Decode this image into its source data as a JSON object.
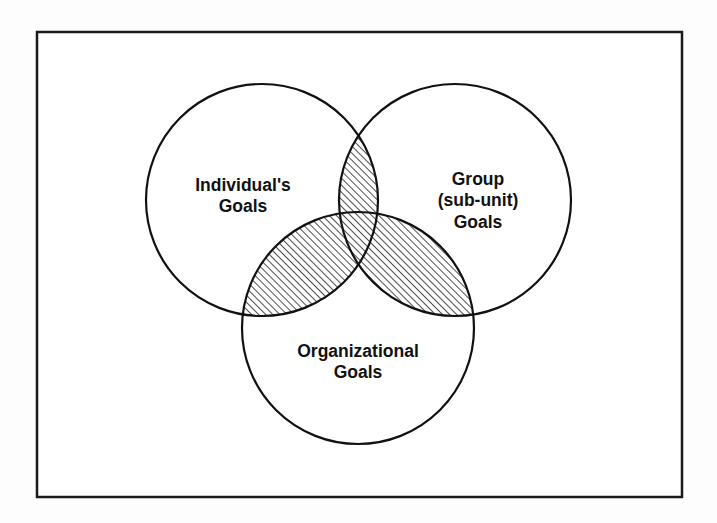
{
  "diagram": {
    "type": "venn",
    "set_count": 3,
    "background_color": "#fdfdfd",
    "frame": {
      "name": "outer-border",
      "stroke_color": "#1a1a1a",
      "fill_color": "#ffffff",
      "x": 37,
      "y": 32,
      "width": 645,
      "height": 465,
      "stroke_width": 2.5
    },
    "style": {
      "circle_stroke_color": "#111111",
      "circle_fill_color": "#ffffff",
      "circle_stroke_width": 2.2,
      "hatch_color": "#111111",
      "hatch_angle_deg": 45,
      "hatch_spacing_px": 5,
      "hatch_line_width": 1.5,
      "label_color": "#111111",
      "label_font_size_px": 17.5,
      "label_font_weight": "bold"
    },
    "circles": [
      {
        "id": "individual",
        "name": "individuals-goals-circle",
        "cx": 262,
        "cy": 200,
        "r": 116,
        "label_lines": [
          "Individual's",
          "Goals"
        ],
        "label_x": 243,
        "label_y": 186
      },
      {
        "id": "group",
        "name": "group-subunit-goals-circle",
        "cx": 455,
        "cy": 200,
        "r": 116,
        "label_lines": [
          "Group",
          "(sub-unit)",
          "Goals"
        ],
        "label_x": 478,
        "label_y": 180
      },
      {
        "id": "organizational",
        "name": "organizational-goals-circle",
        "cx": 358,
        "cy": 328,
        "r": 116,
        "label_lines": [
          "Organizational",
          "Goals"
        ],
        "label_x": 358,
        "label_y": 352
      }
    ],
    "intersections": [
      {
        "id": "individual-group",
        "name": "individual-group-intersection",
        "sets": [
          "individual",
          "group"
        ],
        "shaded": true,
        "shading": "diagonal-hatch"
      },
      {
        "id": "individual-organizational",
        "name": "individual-organizational-intersection",
        "sets": [
          "individual",
          "organizational"
        ],
        "shaded": true,
        "shading": "diagonal-hatch"
      },
      {
        "id": "group-organizational",
        "name": "group-organizational-intersection",
        "sets": [
          "group",
          "organizational"
        ],
        "shaded": true,
        "shading": "diagonal-hatch"
      }
    ]
  }
}
